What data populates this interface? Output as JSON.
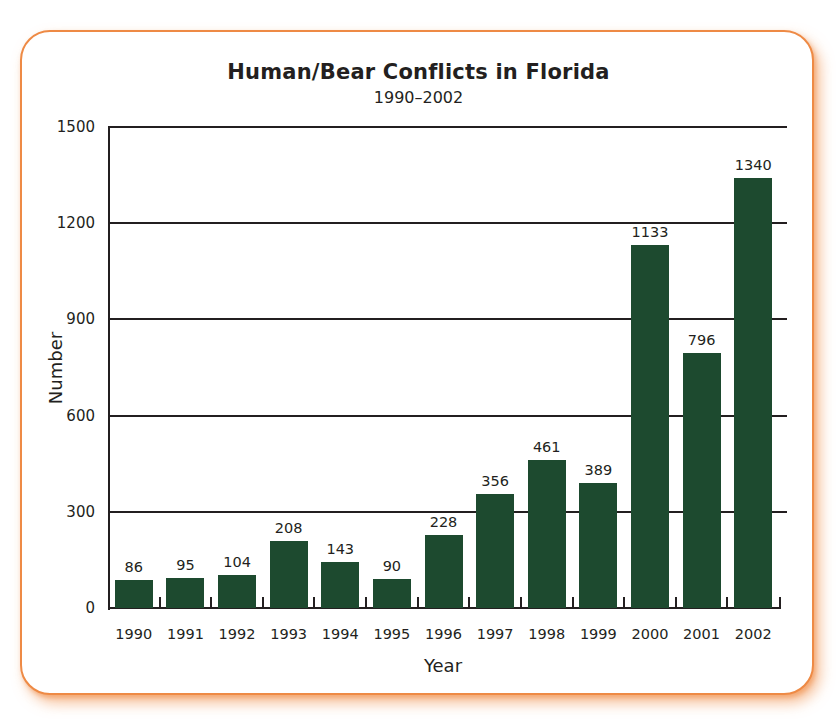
{
  "chart_data": {
    "type": "bar",
    "title": "Human/Bear Conflicts in Florida",
    "subtitle": "1990–2002",
    "xlabel": "Year",
    "ylabel": "Number",
    "categories": [
      "1990",
      "1991",
      "1992",
      "1993",
      "1994",
      "1995",
      "1996",
      "1997",
      "1998",
      "1999",
      "2000",
      "2001",
      "2002"
    ],
    "values": [
      86,
      95,
      104,
      208,
      143,
      90,
      228,
      356,
      461,
      389,
      1133,
      796,
      1340
    ],
    "data_labels": [
      "86",
      "95",
      "104",
      "208",
      "143",
      "90",
      "228",
      "356",
      "461",
      "389",
      "1133",
      "796",
      "1340"
    ],
    "yticks": [
      "0",
      "300",
      "600",
      "900",
      "1200",
      "1500"
    ],
    "ytick_values": [
      0,
      300,
      600,
      900,
      1200,
      1500
    ],
    "ylim": [
      0,
      1500
    ],
    "grid": true,
    "legend": null,
    "colors": {
      "bar": "#1d4a2f",
      "frame": "#ee8a45",
      "text": "#231f20"
    }
  }
}
